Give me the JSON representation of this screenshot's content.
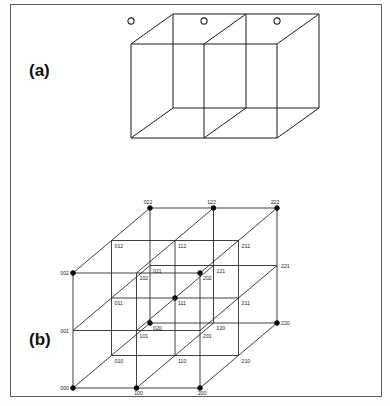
{
  "figure": {
    "panels": [
      {
        "id": "a",
        "label": "(a)",
        "caption_text": "(a)"
      },
      {
        "id": "b",
        "label": "(b)",
        "caption_text": "(b)"
      }
    ]
  },
  "colors": {
    "frame": "#5a5a5a",
    "line": "#1a1a1a",
    "node_open_fill": "#ffffff",
    "node_solid_fill": "#0a0a0a",
    "label_text": "#1d1d1d",
    "background": "#ffffff"
  },
  "panel_a": {
    "description": "unit cell with open-circle lattice sites",
    "cube": {
      "origin_x": 120,
      "origin_y": 125,
      "width": 146,
      "height": 94,
      "depth_x": 42,
      "depth_y": -30
    },
    "node_symbol": "open-circle",
    "node_radius": 3.1,
    "nodes": [
      {
        "name": "corner-front-bottom-left",
        "x": 120,
        "y": 125
      },
      {
        "name": "corner-front-bottom-right",
        "x": 266,
        "y": 125
      },
      {
        "name": "corner-front-top-left",
        "x": 120,
        "y": 31
      },
      {
        "name": "corner-front-top-right",
        "x": 266,
        "y": 31
      },
      {
        "name": "corner-back-bottom-left",
        "x": 162,
        "y": 95
      },
      {
        "name": "corner-back-bottom-right",
        "x": 308,
        "y": 95
      },
      {
        "name": "corner-back-top-left",
        "x": 162,
        "y": 1
      },
      {
        "name": "corner-back-top-right",
        "x": 308,
        "y": 1
      },
      {
        "name": "mid-front-bottom",
        "x": 193,
        "y": 125
      },
      {
        "name": "mid-front-top",
        "x": 193,
        "y": 31
      },
      {
        "name": "mid-back-bottom",
        "x": 235,
        "y": 95
      },
      {
        "name": "mid-back-top",
        "x": 235,
        "y": 1
      },
      {
        "name": "mid-plane-site-left",
        "x": 193,
        "y": 78
      },
      {
        "name": "mid-plane-site-right",
        "x": 235,
        "y": 48
      },
      {
        "name": "face-site-left",
        "x": 152,
        "y": 78
      },
      {
        "name": "face-site-right",
        "x": 287,
        "y": 78
      }
    ]
  },
  "panel_b": {
    "description": "3x3x3 lattice with ternary index labels",
    "lattice": {
      "origin_x": 62,
      "origin_y": 383,
      "step_x": 63.5,
      "step_y": -57.5,
      "depth_x": 38.5,
      "depth_y": -32.5,
      "n": 3
    },
    "solid_node_radius": 2.3,
    "index_labels": [
      "000",
      "100",
      "200",
      "010",
      "110",
      "210",
      "020",
      "120",
      "220",
      "001",
      "101",
      "201",
      "011",
      "111",
      "211",
      "021",
      "121",
      "221",
      "002",
      "102",
      "202",
      "012",
      "112",
      "212",
      "022",
      "122",
      "222"
    ],
    "solid_nodes": [
      "000",
      "100",
      "200",
      "020",
      "220",
      "002",
      "202",
      "022",
      "122",
      "222",
      "111"
    ],
    "axis_order": "label digits are (x y z) indices, each in {0,1,2}"
  }
}
